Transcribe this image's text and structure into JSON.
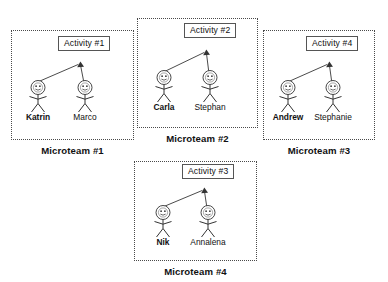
{
  "diagram": {
    "teams": [
      {
        "caption": "Microteam #1",
        "activity": "Activity #1",
        "actors": [
          {
            "name": "Katrin",
            "emphasis": "bold",
            "role": "initiator"
          },
          {
            "name": "Marco",
            "emphasis": "regular",
            "role": "member"
          }
        ]
      },
      {
        "caption": "Microteam #2",
        "activity": "Activity #2",
        "actors": [
          {
            "name": "Carla",
            "emphasis": "bold",
            "role": "initiator"
          },
          {
            "name": "Stephan",
            "emphasis": "regular",
            "role": "member"
          }
        ]
      },
      {
        "caption": "Microteam #3",
        "activity": "Activity #4",
        "actors": [
          {
            "name": "Andrew",
            "emphasis": "bold",
            "role": "initiator"
          },
          {
            "name": "Stephanie",
            "emphasis": "regular",
            "role": "member"
          }
        ]
      },
      {
        "caption": "Microteam #4",
        "activity": "Activity #3",
        "actors": [
          {
            "name": "Nik",
            "emphasis": "bold",
            "role": "initiator"
          },
          {
            "name": "Annalena",
            "emphasis": "regular",
            "role": "member"
          }
        ]
      }
    ],
    "colors": {
      "border": "#4a4a4a",
      "box_border": "#555555",
      "text": "#111111",
      "line": "#333333",
      "background": "#ffffff"
    }
  }
}
